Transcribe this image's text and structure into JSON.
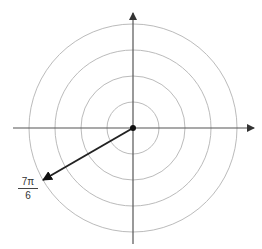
{
  "diagram": {
    "type": "polar-grid",
    "center": [
      133,
      128
    ],
    "circle_radii": [
      26,
      52,
      78,
      104
    ],
    "angle_label": {
      "numerator": "7π",
      "denominator": "6"
    },
    "angle_radians": "7π/6",
    "colors": {
      "grid": "#bbbbbb",
      "axis": "#555555",
      "vector": "#222222"
    }
  }
}
